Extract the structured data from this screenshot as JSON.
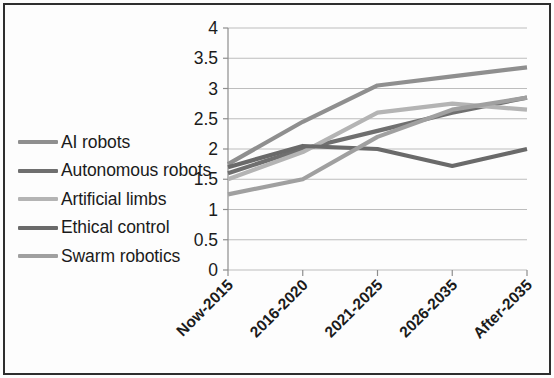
{
  "chart_data": {
    "type": "line",
    "title": "",
    "subtitle": "",
    "xlabel": "",
    "ylabel": "",
    "categories": [
      "Now-2015",
      "2016-2020",
      "2021-2025",
      "2026-2035",
      "After-2035"
    ],
    "ylim": [
      0,
      4
    ],
    "ytick_labels": [
      "0",
      "0.5",
      "1",
      "1.5",
      "2",
      "2.5",
      "3",
      "3.5",
      "4"
    ],
    "ytick_values": [
      0,
      0.5,
      1,
      1.5,
      2,
      2.5,
      3,
      3.5,
      4
    ],
    "grid": true,
    "legend_position": "left-outside",
    "series": [
      {
        "name": "AI robots",
        "color": "#8f8f8f",
        "values": [
          1.75,
          2.45,
          3.05,
          3.2,
          3.35
        ]
      },
      {
        "name": "Autonomous robots",
        "color": "#6f6f6f",
        "values": [
          1.6,
          2.0,
          2.3,
          2.6,
          2.85
        ]
      },
      {
        "name": "Artificial limbs",
        "color": "#b4b4b4",
        "values": [
          1.5,
          1.95,
          2.6,
          2.75,
          2.65
        ]
      },
      {
        "name": "Ethical control",
        "color": "#6a6a6a",
        "values": [
          1.7,
          2.05,
          2.0,
          1.72,
          2.0
        ]
      },
      {
        "name": "Swarm robotics",
        "color": "#a0a0a0",
        "values": [
          1.25,
          1.5,
          2.2,
          2.65,
          2.85
        ]
      }
    ]
  },
  "legend": {
    "items": [
      {
        "label": "AI robots"
      },
      {
        "label": "Autonomous robots"
      },
      {
        "label": "Artificial limbs"
      },
      {
        "label": "Ethical control"
      },
      {
        "label": "Swarm robotics"
      }
    ]
  }
}
